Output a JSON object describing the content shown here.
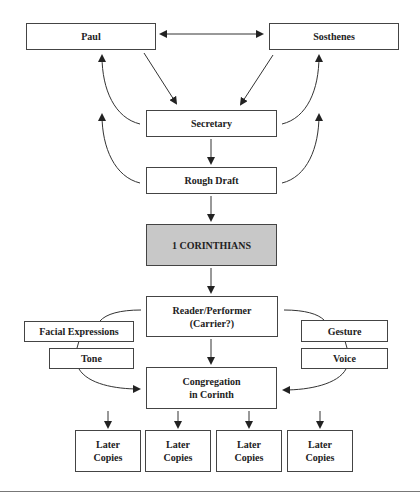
{
  "diagram": {
    "nodes": {
      "paul": "Paul",
      "sosthenes": "Sosthenes",
      "secretary": "Secretary",
      "rough_draft": "Rough Draft",
      "corinthians": "1 CORINTHIANS",
      "reader": "Reader/Performer\n(Carrier?)",
      "facial": "Facial Expressions",
      "tone": "Tone",
      "gesture": "Gesture",
      "voice": "Voice",
      "congregation": "Congregation\nin Corinth",
      "copies": [
        "Later\nCopies",
        "Later\nCopies",
        "Later\nCopies",
        "Later\nCopies"
      ]
    },
    "edges": [
      {
        "from": "Paul",
        "to": "Sosthenes",
        "type": "bidirectional"
      },
      {
        "from": "Paul",
        "to": "Secretary"
      },
      {
        "from": "Sosthenes",
        "to": "Secretary"
      },
      {
        "from": "Secretary",
        "to": "Paul",
        "type": "curved"
      },
      {
        "from": "Secretary",
        "to": "Sosthenes",
        "type": "curved"
      },
      {
        "from": "Rough Draft",
        "to": "Paul",
        "type": "curved"
      },
      {
        "from": "Rough Draft",
        "to": "Sosthenes",
        "type": "curved"
      },
      {
        "from": "Secretary",
        "to": "Rough Draft"
      },
      {
        "from": "Rough Draft",
        "to": "1 CORINTHIANS"
      },
      {
        "from": "1 CORINTHIANS",
        "to": "Reader/Performer"
      },
      {
        "from": "Reader/Performer",
        "to": "Congregation in Corinth"
      },
      {
        "from": "Reader/Performer",
        "to": "Congregation in Corinth",
        "via": [
          "Facial Expressions",
          "Tone"
        ]
      },
      {
        "from": "Reader/Performer",
        "to": "Congregation in Corinth",
        "via": [
          "Gesture",
          "Voice"
        ]
      },
      {
        "from": "Congregation in Corinth",
        "to": "Later Copies",
        "count": 4
      }
    ],
    "colors": {
      "shaded_fill": "#c8c8c8",
      "line": "#333333"
    }
  }
}
